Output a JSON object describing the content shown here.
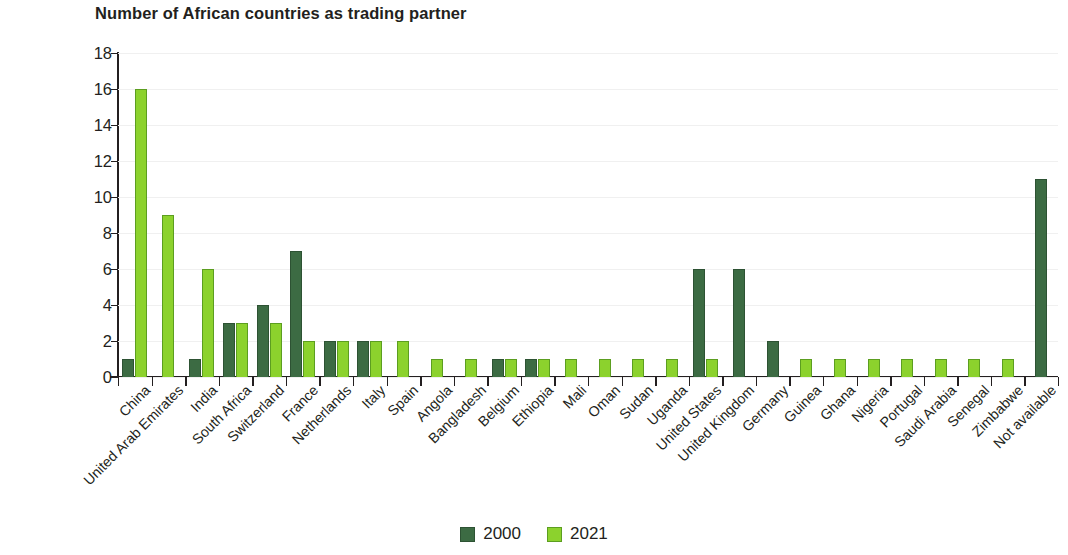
{
  "chart_data": {
    "type": "bar",
    "title": "Number of African countries as trading partner",
    "xlabel": "",
    "ylabel": "",
    "ylim": [
      0,
      18
    ],
    "yticks": [
      0,
      2,
      4,
      6,
      8,
      10,
      12,
      14,
      16,
      18
    ],
    "grid": true,
    "legend_position": "bottom",
    "colors": {
      "2000": "#3c6b43",
      "2021": "#8cd22d"
    },
    "categories": [
      "China",
      "United Arab Emirates",
      "India",
      "South Africa",
      "Switzerland",
      "France",
      "Netherlands",
      "Italy",
      "Spain",
      "Angola",
      "Bangladesh",
      "Belgium",
      "Ethiopia",
      "Mali",
      "Oman",
      "Sudan",
      "Uganda",
      "United States",
      "United Kingdom",
      "Germany",
      "Guinea",
      "Ghana",
      "Nigeria",
      "Portugal",
      "Saudi Arabia",
      "Senegal",
      "Zimbabwe",
      "Not available"
    ],
    "series": [
      {
        "name": "2000",
        "color": "#3c6b43",
        "values": [
          1,
          0,
          1,
          3,
          4,
          7,
          2,
          2,
          0,
          0,
          0,
          1,
          1,
          0,
          0,
          0,
          0,
          6,
          6,
          2,
          0,
          0,
          0,
          0,
          0,
          0,
          0,
          11
        ]
      },
      {
        "name": "2021",
        "color": "#8cd22d",
        "values": [
          16,
          9,
          6,
          3,
          3,
          2,
          2,
          2,
          2,
          1,
          1,
          1,
          1,
          1,
          1,
          1,
          1,
          1,
          0,
          0,
          1,
          1,
          1,
          1,
          1,
          1,
          1,
          0
        ]
      }
    ]
  },
  "legend": {
    "items": [
      {
        "label": "2000"
      },
      {
        "label": "2021"
      }
    ]
  }
}
